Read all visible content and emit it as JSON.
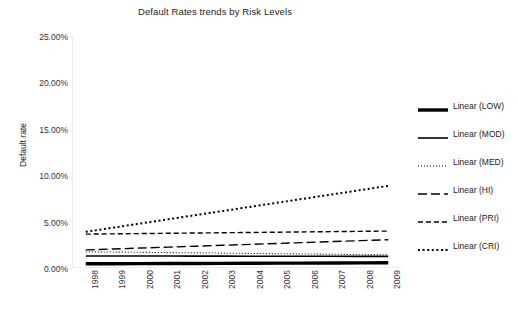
{
  "chart_data": {
    "type": "line",
    "title": "Default Rates trends by Risk Levels",
    "xlabel": "",
    "ylabel": "Default rate",
    "x": [
      1998,
      1999,
      2000,
      2001,
      2002,
      2003,
      2004,
      2005,
      2006,
      2007,
      2008,
      2009
    ],
    "xticklabels": [
      "1998",
      "1999",
      "2000",
      "2001",
      "2002",
      "2003",
      "2004",
      "2005",
      "2006",
      "2007",
      "2008",
      "2009"
    ],
    "yticklabels": [
      "0.00%",
      "5.00%",
      "10.00%",
      "15.00%",
      "20.00%",
      "25.00%"
    ],
    "ytickvalues": [
      0,
      5,
      10,
      15,
      20,
      25
    ],
    "ylim": [
      0,
      25
    ],
    "grid": false,
    "legend_position": "right",
    "series": [
      {
        "name": "Linear (LOW)",
        "style": "thick-solid",
        "values": [
          0.45,
          0.46,
          0.47,
          0.48,
          0.49,
          0.5,
          0.51,
          0.52,
          0.53,
          0.54,
          0.55,
          0.56
        ]
      },
      {
        "name": "Linear (MOD)",
        "style": "solid",
        "values": [
          1.3,
          1.3,
          1.29,
          1.29,
          1.28,
          1.28,
          1.27,
          1.27,
          1.26,
          1.26,
          1.25,
          1.25
        ]
      },
      {
        "name": "Linear (MED)",
        "style": "fine-dotted",
        "values": [
          1.75,
          1.72,
          1.69,
          1.66,
          1.63,
          1.6,
          1.57,
          1.54,
          1.51,
          1.48,
          1.45,
          1.42
        ]
      },
      {
        "name": "Linear (HI)",
        "style": "dashed-long",
        "values": [
          1.95,
          2.05,
          2.15,
          2.25,
          2.35,
          2.45,
          2.55,
          2.65,
          2.75,
          2.85,
          2.95,
          3.05
        ]
      },
      {
        "name": "Linear (PRI)",
        "style": "dashed",
        "values": [
          3.65,
          3.68,
          3.71,
          3.74,
          3.77,
          3.8,
          3.83,
          3.86,
          3.89,
          3.92,
          3.95,
          3.98
        ]
      },
      {
        "name": "Linear (CRI)",
        "style": "dotted",
        "values": [
          3.9,
          4.35,
          4.8,
          5.25,
          5.7,
          6.15,
          6.6,
          7.05,
          7.5,
          7.95,
          8.4,
          8.85
        ]
      }
    ]
  },
  "legend": {
    "items": [
      {
        "label": "Linear (LOW)"
      },
      {
        "label": "Linear (MOD)"
      },
      {
        "label": "Linear (MED)"
      },
      {
        "label": "Linear (HI)"
      },
      {
        "label": "Linear (PRI)"
      },
      {
        "label": "Linear (CRI)"
      }
    ]
  },
  "colors": {
    "line": "#000000",
    "axis": "#d9d9d9",
    "text": "#222222"
  }
}
